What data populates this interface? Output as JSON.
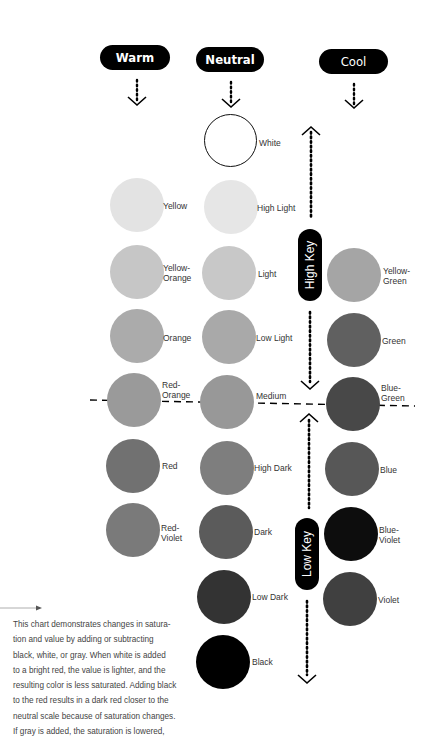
{
  "headers": {
    "warm": "Warm",
    "neutral": "Neutral",
    "cool": "Cool"
  },
  "key_labels": {
    "high": "High Key",
    "low": "Low Key"
  },
  "warm": [
    {
      "label": "Yellow",
      "color": "#e3e3e3"
    },
    {
      "label": "Yellow-\nOrange",
      "color": "#c6c6c6"
    },
    {
      "label": "Orange",
      "color": "#ababab"
    },
    {
      "label": "Red-\nOrange",
      "color": "#9a9a9a"
    },
    {
      "label": "Red",
      "color": "#717171"
    },
    {
      "label": "Red-\nViolet",
      "color": "#7a7a7a"
    }
  ],
  "neutral": [
    {
      "label": "White",
      "color": "#ffffff"
    },
    {
      "label": "High Light",
      "color": "#e6e6e6"
    },
    {
      "label": "Light",
      "color": "#c8c8c8"
    },
    {
      "label": "Low Light",
      "color": "#a9a9a9"
    },
    {
      "label": "Medium",
      "color": "#989898"
    },
    {
      "label": "High Dark",
      "color": "#7e7e7e"
    },
    {
      "label": "Dark",
      "color": "#5b5b5b"
    },
    {
      "label": "Low Dark",
      "color": "#333333"
    },
    {
      "label": "Black",
      "color": "#000000"
    }
  ],
  "cool": [
    {
      "label": "Yellow-\nGreen",
      "color": "#a5a5a5"
    },
    {
      "label": "Green",
      "color": "#606060"
    },
    {
      "label": "Blue-\nGreen",
      "color": "#484848"
    },
    {
      "label": "Blue",
      "color": "#575757"
    },
    {
      "label": "Blue-\nViolet",
      "color": "#0d0d0d"
    },
    {
      "label": "Violet",
      "color": "#404040"
    }
  ],
  "caption": "This chart demonstrates changes in satura-\ntion and value by adding or subtracting\nblack, white, or gray. When white is added\nto a bright red, the value is lighter, and the\nresulting color is less saturated. Adding black\nto the red results in a dark red closer to the\nneutral scale because of saturation changes.\nIf gray is added, the saturation is lowered,"
}
